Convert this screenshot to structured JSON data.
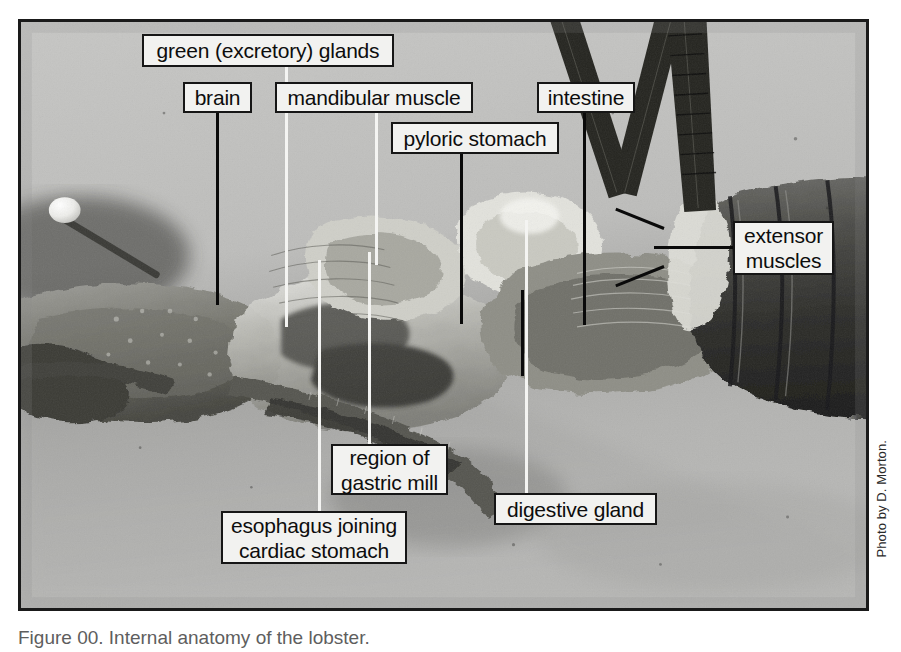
{
  "figure": {
    "kind": "anatomical-dissection-photograph",
    "credit": "Photo by D. Morton.",
    "caption_partial": "Figure 00. Internal anatomy of the lobster."
  },
  "colors": {
    "label_fill": "#f2f2f0",
    "label_border": "#161616",
    "leader_dark": "#0a0a0a",
    "leader_light": "#f4f4f2",
    "frame_border": "#1a1a1a",
    "photo_background": "#b9b9b9",
    "credit_text": "#2a2a2a"
  },
  "labels": [
    {
      "id": "green-glands",
      "text": "green (excretory) glands",
      "x": 142,
      "y": 34,
      "w": 252,
      "h": 33,
      "leader_color": "light"
    },
    {
      "id": "brain",
      "text": "brain",
      "x": 183,
      "y": 82,
      "w": 69,
      "h": 31,
      "leader_color": "dark"
    },
    {
      "id": "mandibular-muscle",
      "text": "mandibular muscle",
      "x": 275,
      "y": 82,
      "w": 198,
      "h": 31,
      "leader_color": "light"
    },
    {
      "id": "intestine",
      "text": "intestine",
      "x": 537,
      "y": 82,
      "w": 98,
      "h": 31,
      "leader_color": "dark"
    },
    {
      "id": "pyloric-stomach",
      "text": "pyloric stomach",
      "x": 391,
      "y": 122,
      "w": 168,
      "h": 32,
      "leader_color": "dark"
    },
    {
      "id": "extensor-muscles",
      "text": "extensor\nmuscles",
      "x": 733,
      "y": 221,
      "w": 101,
      "h": 54,
      "leader_color": "dark"
    },
    {
      "id": "region-of-gastric-mill",
      "text": "region of\ngastric mill",
      "x": 331,
      "y": 444,
      "w": 117,
      "h": 51,
      "leader_color": "light"
    },
    {
      "id": "digestive-gland",
      "text": "digestive gland",
      "x": 494,
      "y": 493,
      "w": 163,
      "h": 32,
      "leader_color": "light"
    },
    {
      "id": "esophagus-cardiac-stomach",
      "text": "esophagus joining\ncardiac stomach",
      "x": 221,
      "y": 511,
      "w": 186,
      "h": 53,
      "leader_color": "light"
    }
  ]
}
